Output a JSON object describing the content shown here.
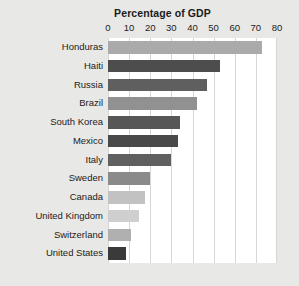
{
  "chart_data": {
    "type": "bar",
    "orientation": "horizontal",
    "title": "Percentage of GDP",
    "xlabel": "",
    "ylabel": "",
    "xlim": [
      0,
      80
    ],
    "xticks": [
      0,
      10,
      20,
      30,
      40,
      50,
      60,
      70,
      80
    ],
    "grid": true,
    "legend": false,
    "categories": [
      "Honduras",
      "Haiti",
      "Russia",
      "Brazil",
      "South Korea",
      "Mexico",
      "Italy",
      "Sweden",
      "Canada",
      "United Kingdom",
      "Switzerland",
      "United States"
    ],
    "values": [
      73,
      53,
      47,
      42,
      34,
      33,
      30,
      20,
      17.5,
      14.5,
      11,
      8.5
    ],
    "bar_colors": [
      "#aaaaaa",
      "#4d4d4d",
      "#5f5f5f",
      "#919191",
      "#575757",
      "#4a4a4a",
      "#606060",
      "#8a8a8a",
      "#c2c2c2",
      "#cfcfcf",
      "#b0b0b0",
      "#3a3a3a"
    ]
  },
  "colors": {
    "background": "#e8e8e6",
    "plot_background": "#ffffff",
    "gridline": "#d6d6d6",
    "text": "#1b1b1b"
  }
}
